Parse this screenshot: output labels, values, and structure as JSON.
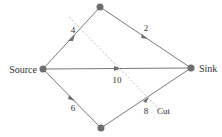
{
  "diagram": {
    "type": "flow-network",
    "colors": {
      "edge": "#7a7a7a",
      "node": "#6e6e6e",
      "cut": "#bdbdbd",
      "text": "#333333"
    },
    "nodes": [
      {
        "id": "source",
        "label": "Source",
        "x": 43,
        "y": 69
      },
      {
        "id": "top",
        "label": "",
        "x": 100,
        "y": 7
      },
      {
        "id": "bottom",
        "label": "",
        "x": 101,
        "y": 128
      },
      {
        "id": "sink",
        "label": "Sink",
        "x": 191,
        "y": 68
      }
    ],
    "edges": [
      {
        "from": "source",
        "to": "top",
        "capacity": "4"
      },
      {
        "from": "top",
        "to": "sink",
        "capacity": "2"
      },
      {
        "from": "source",
        "to": "sink",
        "capacity": "10"
      },
      {
        "from": "source",
        "to": "bottom",
        "capacity": "6"
      },
      {
        "from": "bottom",
        "to": "sink",
        "capacity": "8"
      }
    ],
    "cut": {
      "label": "Cut",
      "x1": 69,
      "y1": 17,
      "x2": 163,
      "y2": 113
    }
  }
}
